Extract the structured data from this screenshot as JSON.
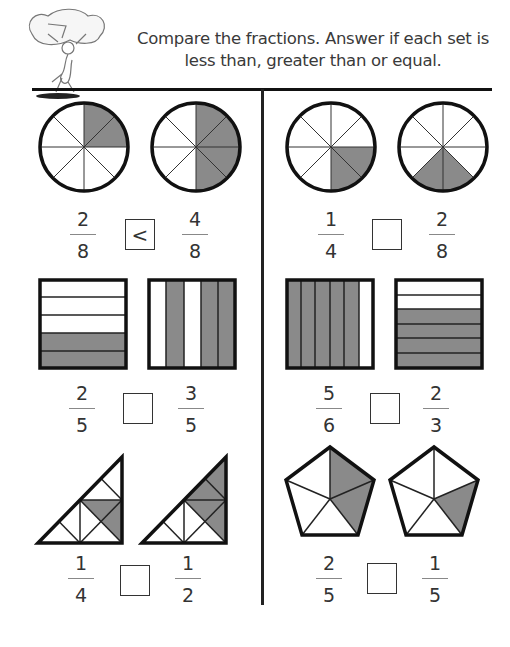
{
  "header": {
    "instructions": "Compare the fractions. Answer if each set is less than, greater than or equal.",
    "mascot_icon": "ant-carrying-rock-icon"
  },
  "colors": {
    "shade": "#8a8a8a",
    "outline": "#111111"
  },
  "problems": [
    {
      "shape": "circle",
      "left": {
        "num": "2",
        "den": "8"
      },
      "answer": "<",
      "right": {
        "num": "4",
        "den": "8"
      }
    },
    {
      "shape": "circle",
      "left": {
        "num": "1",
        "den": "4"
      },
      "answer": "",
      "right": {
        "num": "2",
        "den": "8"
      }
    },
    {
      "shape": "square",
      "left": {
        "num": "2",
        "den": "5"
      },
      "answer": "",
      "right": {
        "num": "3",
        "den": "5"
      }
    },
    {
      "shape": "square",
      "left": {
        "num": "5",
        "den": "6"
      },
      "answer": "",
      "right": {
        "num": "2",
        "den": "3"
      }
    },
    {
      "shape": "triangle",
      "left": {
        "num": "1",
        "den": "4"
      },
      "answer": "",
      "right": {
        "num": "1",
        "den": "2"
      }
    },
    {
      "shape": "pentagon",
      "left": {
        "num": "2",
        "den": "5"
      },
      "answer": "",
      "right": {
        "num": "1",
        "den": "5"
      }
    }
  ]
}
